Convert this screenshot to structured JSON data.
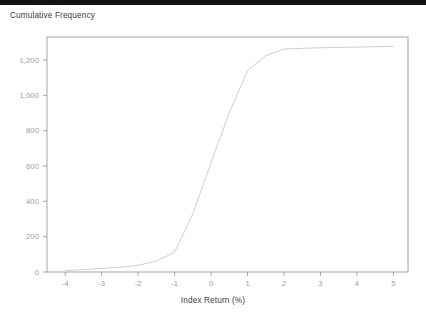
{
  "window": {
    "top_strip_color": "#141414",
    "background_color": "#ffffff"
  },
  "chart_data": {
    "type": "line",
    "title": "Cumulative Frequency",
    "subtitle": "",
    "xlabel": "Index Return (%)",
    "ylabel": "",
    "x": [
      -4,
      -3.5,
      -3,
      -2.5,
      -2,
      -1.5,
      -1,
      -0.5,
      0,
      0.5,
      1,
      1.5,
      2,
      2.5,
      3,
      3.5,
      4,
      4.5,
      5
    ],
    "values": [
      8,
      14,
      20,
      27,
      38,
      62,
      112,
      330,
      620,
      900,
      1140,
      1225,
      1262,
      1266,
      1269,
      1271,
      1273,
      1275,
      1277
    ],
    "series": [
      {
        "name": "Cumulative Frequency",
        "values": [
          8,
          14,
          20,
          27,
          38,
          62,
          112,
          330,
          620,
          900,
          1140,
          1225,
          1262,
          1266,
          1269,
          1271,
          1273,
          1275,
          1277
        ]
      }
    ],
    "xlim": [
      -4.5,
      5.4
    ],
    "ylim": [
      0,
      1330
    ],
    "xticks": [
      -4,
      -3,
      -2,
      -1,
      0,
      1,
      2,
      3,
      4,
      5
    ],
    "xtick_labels": [
      "-4",
      "-3",
      "-2",
      "-1",
      "0",
      "1",
      "2",
      "3",
      "4",
      "5"
    ],
    "yticks": [
      0,
      200,
      400,
      600,
      800,
      1000,
      1200
    ],
    "ytick_labels": [
      "0",
      "200",
      "400",
      "600",
      "800",
      "1,000",
      "1,200"
    ],
    "grid": false,
    "legend": false,
    "legend_position": "none",
    "line_color": "#c8c8c8",
    "axis_color": "#8f8f8f",
    "tick_label_color": "#9a9a9a",
    "title_color": "#3b3b3b",
    "annotations": []
  }
}
